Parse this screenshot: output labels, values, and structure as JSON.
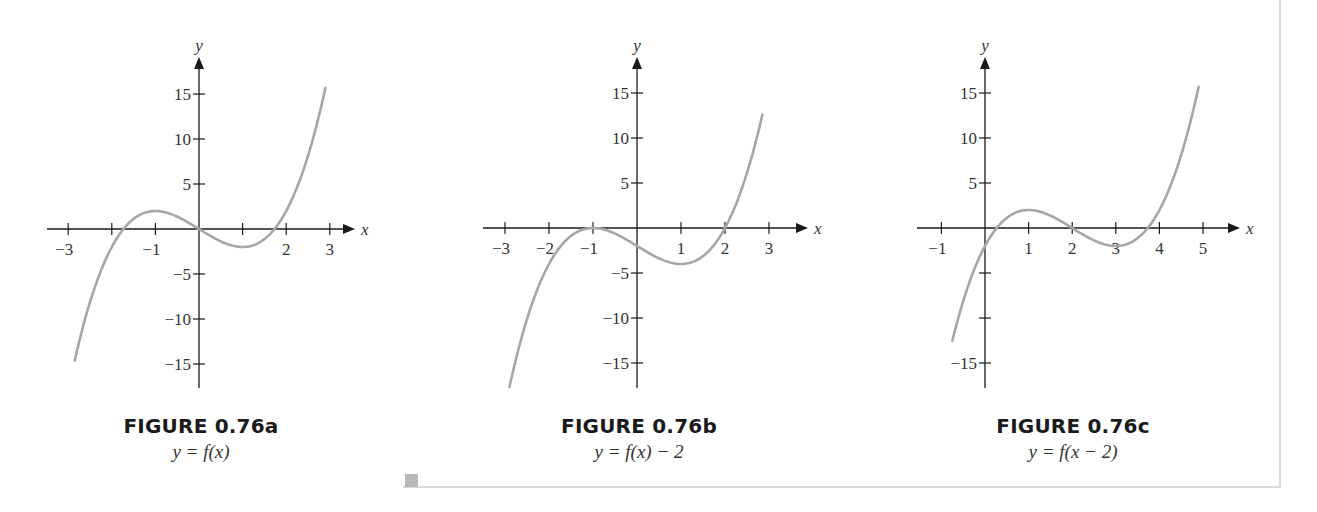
{
  "figures": [
    {
      "id": "a",
      "title": "FIGURE 0.76a",
      "subtitle": "y = f(x)",
      "x_label": "x",
      "y_label": "y"
    },
    {
      "id": "b",
      "title": "FIGURE 0.76b",
      "subtitle": "y = f(x) − 2",
      "x_label": "x",
      "y_label": "y"
    },
    {
      "id": "c",
      "title": "FIGURE 0.76c",
      "subtitle": "y = f(x − 2)",
      "x_label": "x",
      "y_label": "y"
    }
  ],
  "colors": {
    "axis": "#1a1a1a",
    "curve": "#a6a6a6",
    "frame": "#d9d9d9",
    "text": "#333333"
  },
  "chart_data": [
    {
      "type": "line",
      "title": "FIGURE 0.76a",
      "subtitle": "y = f(x)",
      "function": "f(x) = x^3 - 3x",
      "xlabel": "x",
      "ylabel": "y",
      "xlim": [
        -3.3,
        3.8
      ],
      "ylim": [
        -18,
        18
      ],
      "x_ticks": [
        -3,
        -2,
        -1,
        0,
        1,
        2,
        3
      ],
      "x_tick_labels": [
        "−3",
        "",
        "−1",
        "",
        "",
        "2",
        "3"
      ],
      "y_ticks": [
        -15,
        -10,
        -5,
        5,
        10,
        15
      ],
      "y_tick_labels": [
        "−15",
        "−10",
        "−5",
        "5",
        "10",
        "15"
      ],
      "x_shift": 0,
      "y_shift": 0,
      "domain": [
        -2.85,
        2.9
      ],
      "key_points": [
        {
          "x": -2.85,
          "y": -14.6
        },
        {
          "x": -1.73,
          "y": 0
        },
        {
          "x": -1,
          "y": 2
        },
        {
          "x": 0,
          "y": 0
        },
        {
          "x": 1,
          "y": -2
        },
        {
          "x": 1.73,
          "y": 0
        },
        {
          "x": 2.9,
          "y": 15.7
        }
      ],
      "grid": false,
      "legend": false,
      "layout": {
        "origin_px": [
          199,
          229
        ],
        "px_per_x": 43.6,
        "px_per_y": 9.0,
        "y_axis_top_px": 57,
        "y_axis_bottom_px": 388,
        "x_axis_left_px": 47,
        "x_axis_right_px": 355
      }
    },
    {
      "type": "line",
      "title": "FIGURE 0.76b",
      "subtitle": "y = f(x) − 2",
      "function": "g(x) = x^3 - 3x - 2",
      "xlabel": "x",
      "ylabel": "y",
      "xlim": [
        -3.3,
        3.8
      ],
      "ylim": [
        -18,
        18
      ],
      "x_ticks": [
        -3,
        -2,
        -1,
        0,
        1,
        2,
        3
      ],
      "x_tick_labels": [
        "−3",
        "−2",
        "−1",
        "",
        "1",
        "2",
        "3"
      ],
      "y_ticks": [
        -15,
        -10,
        -5,
        5,
        10,
        15
      ],
      "y_tick_labels": [
        "−15",
        "−10",
        "−5",
        "5",
        "10",
        "15"
      ],
      "x_shift": 0,
      "y_shift": -2,
      "domain": [
        -2.9,
        2.85
      ],
      "key_points": [
        {
          "x": -2.9,
          "y": -17.7
        },
        {
          "x": -1,
          "y": 0
        },
        {
          "x": 0,
          "y": -2
        },
        {
          "x": 1,
          "y": -4
        },
        {
          "x": 2,
          "y": 0
        },
        {
          "x": 2.85,
          "y": 12.6
        }
      ],
      "grid": false,
      "legend": false,
      "layout": {
        "origin_px": [
          637,
          228
        ],
        "px_per_x": 44.0,
        "px_per_y": 9.0,
        "y_axis_top_px": 57,
        "y_axis_bottom_px": 388,
        "x_axis_left_px": 483,
        "x_axis_right_px": 808
      }
    },
    {
      "type": "line",
      "title": "FIGURE 0.76c",
      "subtitle": "y = f(x − 2)",
      "function": "h(x) = (x-2)^3 - 3(x-2)",
      "xlabel": "x",
      "ylabel": "y",
      "xlim": [
        -1.6,
        5.8
      ],
      "ylim": [
        -18,
        18
      ],
      "x_ticks": [
        -1,
        0,
        1,
        2,
        3,
        4,
        5
      ],
      "x_tick_labels": [
        "−1",
        "",
        "1",
        "2",
        "3",
        "4",
        "5"
      ],
      "y_ticks": [
        -15,
        -10,
        -5,
        5,
        10,
        15
      ],
      "y_tick_labels": [
        "−15",
        "",
        "",
        "5",
        "10",
        "15"
      ],
      "x_shift": 2,
      "y_shift": 0,
      "domain": [
        -0.75,
        4.9
      ],
      "key_points": [
        {
          "x": -0.75,
          "y": -12.5
        },
        {
          "x": 0,
          "y": -2
        },
        {
          "x": 0.27,
          "y": 0
        },
        {
          "x": 1,
          "y": 2
        },
        {
          "x": 2,
          "y": 0
        },
        {
          "x": 3,
          "y": -2
        },
        {
          "x": 3.73,
          "y": 0
        },
        {
          "x": 4.9,
          "y": 15.7
        }
      ],
      "grid": false,
      "legend": false,
      "layout": {
        "origin_px": [
          985,
          228
        ],
        "px_per_x": 43.6,
        "px_per_y": 9.0,
        "y_axis_top_px": 57,
        "y_axis_bottom_px": 388,
        "x_axis_left_px": 917,
        "x_axis_right_px": 1240
      }
    }
  ]
}
